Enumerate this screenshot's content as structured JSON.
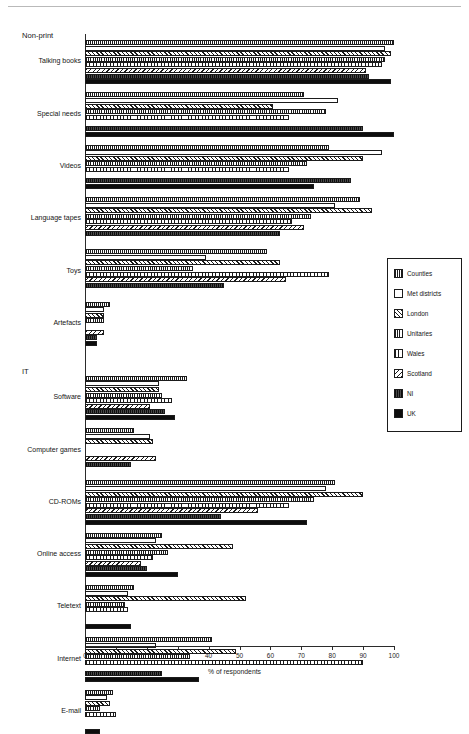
{
  "chart_data": {
    "type": "bar",
    "orientation": "horizontal",
    "title": "",
    "xlabel": "% of respondents",
    "ylabel": "",
    "xlim": [
      0,
      100
    ],
    "xticks": [
      0,
      10,
      20,
      30,
      40,
      50,
      60,
      70,
      80,
      90,
      100
    ],
    "grid": false,
    "legend_position": "right",
    "groups": [
      {
        "name": "Non-print",
        "categories": [
          "Talking books",
          "Special needs",
          "Videos",
          "Language tapes",
          "Toys",
          "Artefacts"
        ]
      },
      {
        "name": "IT",
        "categories": [
          "Software",
          "Computer games",
          "CD-ROMs",
          "Online access",
          "Teletext",
          "Internet",
          "E-mail"
        ]
      }
    ],
    "categories": [
      "Talking books",
      "Special needs",
      "Videos",
      "Language tapes",
      "Toys",
      "Artefacts",
      "Software",
      "Computer games",
      "CD-ROMs",
      "Online access",
      "Teletext",
      "Internet",
      "E-mail"
    ],
    "series": [
      {
        "name": "Counties",
        "pattern": "counties",
        "values": [
          100,
          71,
          79,
          89,
          59,
          8,
          33,
          16,
          81,
          25,
          16,
          41,
          9
        ]
      },
      {
        "name": "Met districts",
        "pattern": "met-districts",
        "values": [
          97,
          82,
          96,
          81,
          39,
          6,
          24,
          21,
          78,
          23,
          14,
          23,
          7
        ]
      },
      {
        "name": "London",
        "pattern": "london",
        "values": [
          99,
          61,
          90,
          93,
          63,
          6,
          24,
          22,
          90,
          48,
          52,
          49,
          8
        ]
      },
      {
        "name": "Unitaries",
        "pattern": "unitaries",
        "values": [
          97,
          78,
          72,
          73,
          35,
          6,
          25,
          0,
          74,
          27,
          13,
          34,
          5
        ]
      },
      {
        "name": "Wales",
        "pattern": "wales",
        "values": [
          96,
          66,
          66,
          67,
          79,
          0,
          28,
          0,
          66,
          22,
          14,
          90,
          10
        ]
      },
      {
        "name": "Scotland",
        "pattern": "scotland",
        "values": [
          91,
          0,
          0,
          71,
          65,
          6,
          21,
          23,
          56,
          18,
          0,
          0,
          0
        ]
      },
      {
        "name": "NI",
        "pattern": "ni",
        "values": [
          92,
          90,
          86,
          63,
          45,
          4,
          26,
          15,
          44,
          20,
          0,
          25,
          0
        ]
      },
      {
        "name": "UK",
        "pattern": "uk",
        "values": [
          99,
          100,
          74,
          0,
          0,
          4,
          29,
          0,
          72,
          30,
          15,
          37,
          5
        ]
      }
    ]
  },
  "legend": {
    "items": [
      {
        "label": "Counties",
        "pattern": "counties"
      },
      {
        "label": "Met districts",
        "pattern": "met-districts"
      },
      {
        "label": "London",
        "pattern": "london"
      },
      {
        "label": "Unitaries",
        "pattern": "unitaries"
      },
      {
        "label": "Wales",
        "pattern": "wales"
      },
      {
        "label": "Scotland",
        "pattern": "scotland"
      },
      {
        "label": "NI",
        "pattern": "ni"
      },
      {
        "label": "UK",
        "pattern": "uk"
      }
    ]
  },
  "colors": {
    "ink": "#1b1b1b",
    "fill_dark": "#0d0d0d",
    "fill_mid": "#3c3c3c",
    "background": "#ffffff"
  }
}
